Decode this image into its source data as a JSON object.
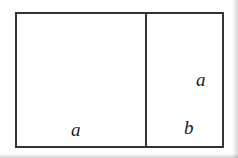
{
  "figure": {
    "type": "geometric-diagram",
    "background_color": "#ffffff",
    "stroke_color": "#333333",
    "label_color": "#1a1a1a",
    "outer_rectangle": {
      "x": 15,
      "y": 12,
      "width": 209,
      "height": 136
    },
    "divider": {
      "orientation": "vertical",
      "x": 145,
      "y_start": 12,
      "y_end": 148
    },
    "labels": [
      {
        "id": "left-region-width",
        "text": "a",
        "style": "italic-serif",
        "x": 71,
        "y": 120
      },
      {
        "id": "right-region-width",
        "text": "b",
        "style": "italic-serif",
        "x": 184,
        "y": 118
      },
      {
        "id": "right-region-height",
        "text": "a",
        "style": "italic-serif",
        "x": 196,
        "y": 70
      }
    ]
  }
}
